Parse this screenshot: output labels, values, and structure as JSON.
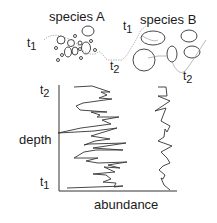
{
  "title_a": "species A",
  "title_b": "species B",
  "time_labels": {
    "a_t1": {
      "base": "t",
      "sub": "1"
    },
    "mid_t2": {
      "base": "t",
      "sub": "2"
    },
    "b_t1": {
      "base": "t",
      "sub": "1"
    },
    "b_t2": {
      "base": "t",
      "sub": "2"
    },
    "axis_t2": {
      "base": "t",
      "sub": "2"
    },
    "axis_t1": {
      "base": "t",
      "sub": "1"
    }
  },
  "axes": {
    "ylabel": "depth",
    "xlabel": "abundance"
  },
  "colors": {
    "ink": "#1a1a1a",
    "trace": "#888888"
  }
}
